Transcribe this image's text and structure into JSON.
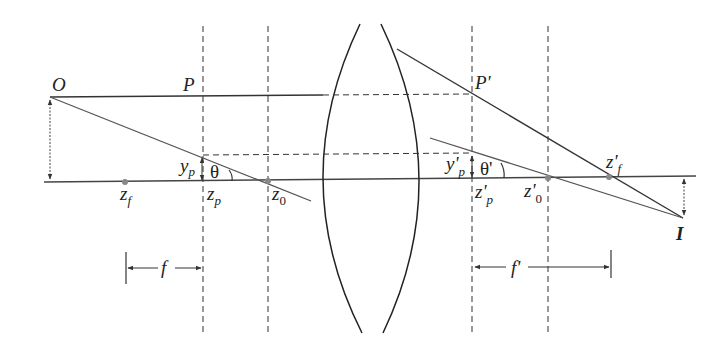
{
  "diagram": {
    "colors": {
      "line": "#333333",
      "ray_gray": "#555555",
      "point": "#888888",
      "background": "#ffffff"
    },
    "labels": {
      "object": "O",
      "P": "P",
      "P_prime": "P'",
      "image": "I",
      "y_p": "y",
      "y_p_sub": "p",
      "y_pp": "y'",
      "y_pp_sub": "p",
      "theta": "θ",
      "theta_prime": "θ'",
      "z_f": "z",
      "z_f_sub": "f",
      "z_p": "z",
      "z_p_sub": "p",
      "z_0": "z",
      "z_0_sub": "0",
      "z_pp": "z'",
      "z_pp_sub": "p",
      "z_0p": "z'",
      "z_0p_sub": "0",
      "z_fp": "z'",
      "z_fp_sub": "f",
      "f": "f",
      "f_prime": "f'"
    },
    "points": {
      "z_f": [
        125,
        182
      ],
      "z_p": [
        203,
        182
      ],
      "z_0": [
        268,
        181
      ],
      "z_pp": [
        472,
        179
      ],
      "z_0p": [
        548,
        178
      ],
      "z_fp": [
        609,
        177
      ],
      "O": [
        50,
        97
      ],
      "I": [
        683,
        218
      ]
    }
  }
}
